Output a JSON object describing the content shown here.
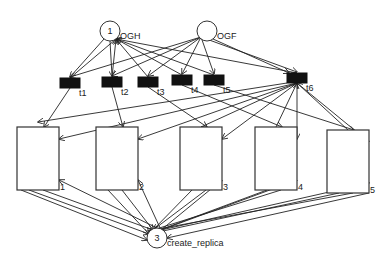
{
  "diagram": {
    "type": "petri-net",
    "places": [
      {
        "id": "OGH",
        "label": "OGH",
        "tokens": "1"
      },
      {
        "id": "OGF",
        "label": "OGF",
        "tokens": ""
      },
      {
        "id": "create_replica",
        "label": "create_replica",
        "tokens": "3"
      }
    ],
    "transitions": [
      {
        "id": "t1",
        "label": "t1"
      },
      {
        "id": "t2",
        "label": "t2"
      },
      {
        "id": "t3",
        "label": "t3"
      },
      {
        "id": "t4",
        "label": "t4"
      },
      {
        "id": "t5",
        "label": "t5"
      },
      {
        "id": "t6",
        "label": "t6"
      }
    ],
    "subnets": [
      {
        "id": "r1",
        "label": "1"
      },
      {
        "id": "r2",
        "label": "2"
      },
      {
        "id": "r3",
        "label": "3"
      },
      {
        "id": "r4",
        "label": "4"
      },
      {
        "id": "r5",
        "label": "5"
      }
    ]
  }
}
